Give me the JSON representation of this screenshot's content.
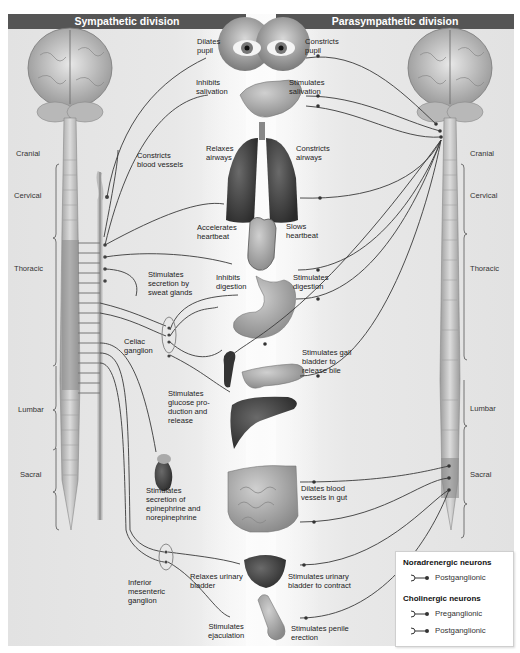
{
  "headers": {
    "sympathetic": "Sympathetic division",
    "parasympathetic": "Parasympathetic division"
  },
  "spinal_regions_left": [
    "Cranial",
    "Cervical",
    "Thoracic",
    "Lumbar",
    "Sacral"
  ],
  "spinal_regions_right": [
    "Cranial",
    "Cervical",
    "Thoracic",
    "Lumbar",
    "Sacral"
  ],
  "ganglia": {
    "celiac": "Celiac\nganglion",
    "inferior_mesenteric": "Inferior\nmesenteric\nganglion"
  },
  "sympathetic_effects": {
    "eye": "Dilates\npupil",
    "salivary": "Inhibits\nsalivation",
    "blood_vessels": "Constricts\nblood vessels",
    "lungs": "Relaxes\nairways",
    "heart": "Accelerates\nheartbeat",
    "sweat": "Stimulates\nsecretion by\nsweat glands",
    "stomach": "Inhibits\ndigestion",
    "liver": "Stimulates\nglucose pro-\nduction and\nrelease",
    "adrenal": "Stimulates\nsecretion of\nepinephrine and\nnorepinephrine",
    "bladder": "Relaxes urinary\nbladder",
    "genitals": "Stimulates\nejaculation"
  },
  "parasympathetic_effects": {
    "eye": "Constricts\npupil",
    "salivary": "Stimulates\nsalivation",
    "lungs": "Constricts\nairways",
    "heart": "Slows\nheartbeat",
    "stomach": "Stimulates\ndigestion",
    "gallbladder": "Stimulates gall\nbladder to\nrelease bile",
    "gut": "Dilates blood\nvessels in gut",
    "bladder": "Stimulates urinary\nbladder to contract",
    "genitals": "Stimulates penile\nerection"
  },
  "organs": [
    "eyes",
    "salivary-gland",
    "lungs",
    "heart",
    "stomach",
    "gallbladder",
    "pancreas",
    "liver",
    "adrenal-gland",
    "intestines",
    "urinary-bladder",
    "penis",
    "brain",
    "spinal-cord"
  ],
  "legend": {
    "noradrenergic_title": "Noradrenergic neurons",
    "noradrenergic_items": [
      "Postganglionic"
    ],
    "cholinergic_title": "Cholinergic neurons",
    "cholinergic_items": [
      "Preganglionic",
      "Postganglionic"
    ]
  },
  "colors": {
    "header_bg": "#555555",
    "panel_bg": "#e6e6e6",
    "nerve": "#3a3a3a"
  }
}
